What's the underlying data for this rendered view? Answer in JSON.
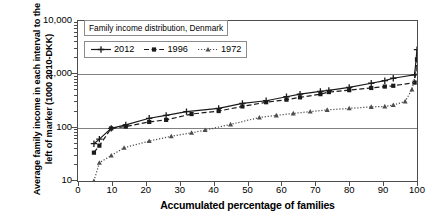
{
  "chart_data": {
    "type": "line",
    "title": "Family income distribution, Denmark",
    "xlabel": "Accumulated percentage of families",
    "ylabel": "Average family income in each interval to the left of marker (1000 2010-DKK)",
    "yscale": "log",
    "ylim": [
      10,
      10000
    ],
    "xlim": [
      0,
      100
    ],
    "grid": true,
    "legend_position": "top-left",
    "ytick_labels": [
      "10",
      "100",
      "1,000",
      "10,000"
    ],
    "ytick_values": [
      10,
      100,
      1000,
      10000
    ],
    "xtick_labels": [
      "0",
      "10",
      "20",
      "30",
      "40",
      "50",
      "60",
      "70",
      "80",
      "90",
      "100"
    ],
    "xtick_values": [
      0,
      10,
      20,
      30,
      40,
      50,
      60,
      70,
      80,
      90,
      100
    ],
    "series": [
      {
        "name": "2012",
        "style": "solid",
        "marker": "plus-diamond",
        "color": "#1a1a1a",
        "x": [
          4.7,
          6.3,
          9.8,
          14.1,
          21.0,
          26.0,
          32.0,
          41.5,
          48.5,
          55.5,
          61.5,
          65.5,
          71.5,
          74.0,
          80.0,
          86.5,
          90.5,
          93.0,
          99.3,
          100.0
        ],
        "y": [
          50,
          61,
          97,
          113,
          150,
          170,
          200,
          230,
          285,
          320,
          380,
          425,
          480,
          500,
          570,
          680,
          760,
          845,
          980,
          2900
        ]
      },
      {
        "name": "1996",
        "style": "dashed",
        "marker": "square",
        "color": "#1a1a1a",
        "x": [
          4.7,
          6.3,
          9.8,
          14.1,
          21.0,
          26.0,
          33.5,
          41.5,
          48.5,
          55.5,
          61.5,
          65.5,
          71.5,
          74.0,
          80.0,
          86.5,
          90.5,
          93.0,
          99.3,
          100.0
        ],
        "y": [
          34,
          46,
          97,
          105,
          128,
          140,
          180,
          205,
          250,
          300,
          335,
          370,
          425,
          465,
          505,
          555,
          590,
          610,
          700,
          1900
        ]
      },
      {
        "name": "1972",
        "style": "dotted",
        "marker": "triangle",
        "color": "#4d4d4d",
        "x": [
          4.7,
          6.3,
          9.8,
          13.6,
          21.0,
          27.5,
          33.5,
          37.5,
          45.0,
          53.5,
          58.5,
          63.5,
          68.5,
          73.5,
          80.0,
          86.5,
          90.5,
          93.0,
          96.5,
          98.5,
          100.0
        ],
        "y": [
          10,
          22,
          30,
          42,
          56,
          69,
          80,
          90,
          115,
          155,
          170,
          185,
          200,
          215,
          230,
          245,
          250,
          265,
          310,
          520,
          1300
        ]
      }
    ]
  },
  "legend": {
    "title": "Family income distribution, Denmark",
    "items": [
      {
        "label": "2012"
      },
      {
        "label": "1996"
      },
      {
        "label": "1972"
      }
    ]
  }
}
